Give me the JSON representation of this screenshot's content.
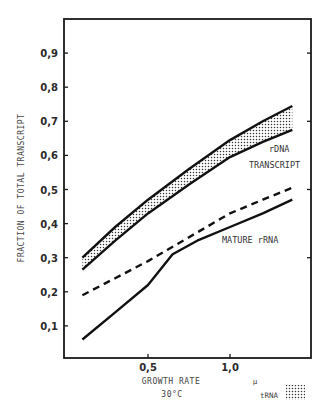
{
  "chart_data": {
    "type": "line",
    "title": "",
    "xlabel": "GROWTH RATE",
    "xlabel_unit": "μ",
    "xlabel_sub": "30°C",
    "ylabel": "FRACTION OF TOTAL TRANSCRIPT",
    "xlim": [
      0,
      1.5
    ],
    "ylim": [
      0,
      1.0
    ],
    "x_ticks": [
      0.5,
      1.0
    ],
    "x_tick_labels": [
      "0,5",
      "1,0"
    ],
    "y_ticks": [
      0.1,
      0.2,
      0.3,
      0.4,
      0.5,
      0.6,
      0.7,
      0.8,
      0.9
    ],
    "y_tick_labels": [
      "0,1",
      "0,2",
      "0,3",
      "0,4",
      "0,5",
      "0,6",
      "0,7",
      "0,8",
      "0,9"
    ],
    "grid": false,
    "series": [
      {
        "name": "rDNA transcript (upper bound)",
        "style": "solid",
        "x": [
          0.1,
          0.3,
          0.5,
          0.75,
          1.0,
          1.2,
          1.38
        ],
        "values": [
          0.3,
          0.39,
          0.47,
          0.56,
          0.645,
          0.7,
          0.745
        ]
      },
      {
        "name": "rDNA transcript (lower bound)",
        "style": "solid",
        "x": [
          0.1,
          0.3,
          0.5,
          0.75,
          1.0,
          1.2,
          1.38
        ],
        "values": [
          0.265,
          0.35,
          0.43,
          0.515,
          0.595,
          0.64,
          0.675
        ]
      },
      {
        "name": "tRNA band boundary (dashed)",
        "style": "dashed",
        "x": [
          0.1,
          0.3,
          0.5,
          0.75,
          1.0,
          1.2,
          1.38
        ],
        "values": [
          0.19,
          0.24,
          0.29,
          0.36,
          0.43,
          0.47,
          0.505
        ]
      },
      {
        "name": "Mature rRNA",
        "style": "solid",
        "x": [
          0.1,
          0.3,
          0.5,
          0.65,
          0.8,
          1.0,
          1.2,
          1.38
        ],
        "values": [
          0.06,
          0.14,
          0.22,
          0.31,
          0.35,
          0.39,
          0.43,
          0.47
        ]
      }
    ],
    "shaded_band": {
      "between": [
        "rDNA transcript (upper bound)",
        "rDNA transcript (lower bound)"
      ],
      "pattern": "stipple",
      "legend": "tRNA"
    },
    "annotations": [
      {
        "text": "rDNA",
        "x": 1.22,
        "y": 0.62
      },
      {
        "text": "TRANSCRIPT",
        "x": 1.1,
        "y": 0.56
      },
      {
        "text": "MATURE rRNA",
        "x": 0.98,
        "y": 0.345
      }
    ],
    "legend": [
      {
        "label": "tRNA",
        "pattern": "stipple"
      }
    ]
  },
  "labels": {
    "ylabel": "FRACTION OF TOTAL TRANSCRIPT",
    "xlabel": "GROWTH RATE",
    "xunit": "μ",
    "xsub": "30°C",
    "annot_rdna": "rDNA",
    "annot_transcript": "TRANSCRIPT",
    "annot_mature": "MATURE rRNA",
    "legend_trna": "tRNA"
  }
}
